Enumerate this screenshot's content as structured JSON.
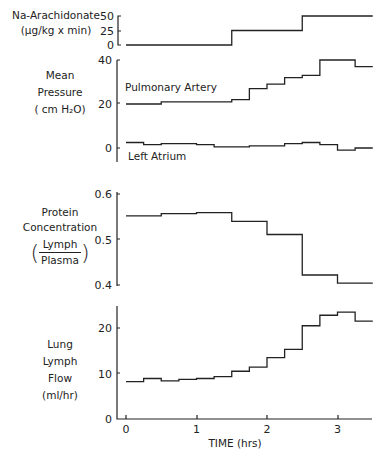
{
  "labels": {
    "na_title": "Na-Arachidonate",
    "na_unit": "(µg/kg x min)",
    "pressure_title_1": "Mean",
    "pressure_title_2": "Pressure",
    "pressure_unit": "( cm H₂O)",
    "pa_label": "Pulmonary Artery",
    "la_label": "Left Atrium",
    "protein_title_1": "Protein",
    "protein_title_2": "Concentration",
    "protein_num": "Lymph",
    "protein_den": "Plasma",
    "flow_title_1": "Lung",
    "flow_title_2": "Lymph",
    "flow_title_3": "Flow",
    "flow_unit": "(ml/hr)",
    "xlabel": "TIME (hrs)"
  },
  "chart_data": [
    {
      "type": "line",
      "title": "Na-Arachidonate (µg/kg x min)",
      "xlabel": "TIME (hrs)",
      "ylabel": "Na-Arachidonate (µg/kg x min)",
      "yticks": [
        0,
        25,
        50
      ],
      "ylim": [
        0,
        50
      ],
      "step": true,
      "x": [
        0,
        1.5,
        2.5,
        3.5
      ],
      "values": [
        0,
        25,
        50,
        50
      ]
    },
    {
      "type": "line",
      "title": "Mean Pressure (cm H2O)",
      "ylabel": "Mean Pressure (cm H2O)",
      "yticks": [
        0,
        20,
        40
      ],
      "ylim": [
        -3,
        40
      ],
      "step": true,
      "x": [
        0,
        0.25,
        0.5,
        0.75,
        1.0,
        1.25,
        1.5,
        1.75,
        2.0,
        2.25,
        2.5,
        2.75,
        3.0,
        3.25,
        3.5
      ],
      "series": [
        {
          "name": "Pulmonary Artery",
          "values": [
            20,
            20,
            21,
            21,
            21,
            21,
            22,
            27,
            29,
            32,
            33,
            40,
            40,
            37,
            37
          ]
        },
        {
          "name": "Left Atrium",
          "values": [
            2.5,
            1.5,
            2,
            2,
            1.5,
            0.5,
            0.5,
            1,
            1,
            2,
            2.5,
            1.5,
            -1,
            0,
            0
          ]
        }
      ]
    },
    {
      "type": "line",
      "title": "Protein Concentration (Lymph/Plasma)",
      "ylabel": "Protein Concentration (Lymph/Plasma)",
      "yticks": [
        0.4,
        0.5,
        0.6
      ],
      "ylim": [
        0.4,
        0.6
      ],
      "step": true,
      "x": [
        0,
        0.5,
        1.0,
        1.5,
        2.0,
        2.5,
        3.0,
        3.5
      ],
      "values": [
        0.552,
        0.557,
        0.559,
        0.54,
        0.511,
        0.422,
        0.404,
        0.404
      ]
    },
    {
      "type": "line",
      "title": "Lung Lymph Flow (ml/hr)",
      "xlabel": "TIME (hrs)",
      "ylabel": "Lung Lymph Flow (ml/hr)",
      "yticks": [
        0,
        10,
        20
      ],
      "xticks": [
        0,
        1,
        2,
        3
      ],
      "ylim": [
        0,
        25
      ],
      "xlim": [
        -0.1,
        3.5
      ],
      "step": true,
      "x": [
        0,
        0.25,
        0.5,
        0.75,
        1.0,
        1.25,
        1.5,
        1.75,
        2.0,
        2.25,
        2.5,
        2.75,
        3.0,
        3.25,
        3.5
      ],
      "values": [
        8.2,
        8.9,
        8.4,
        8.7,
        8.9,
        9.3,
        10.5,
        11.4,
        13.5,
        15.3,
        20.5,
        22.8,
        23.5,
        21.5,
        21.5
      ]
    }
  ]
}
